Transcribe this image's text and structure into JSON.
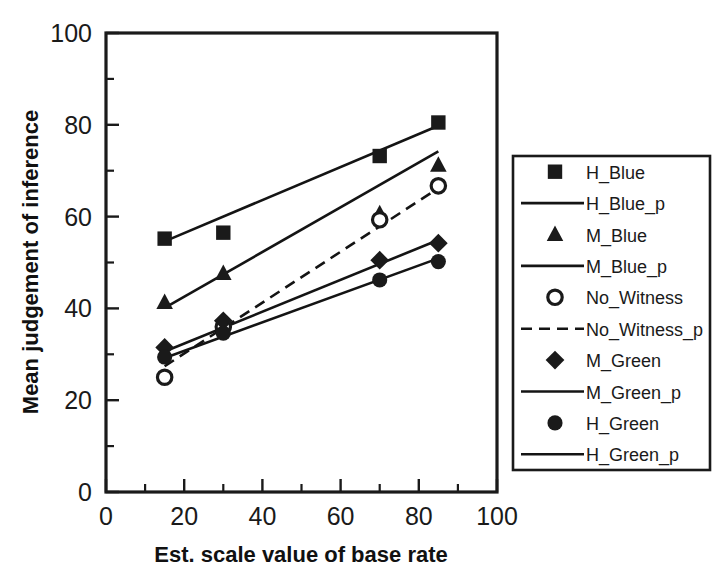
{
  "chart_data": {
    "type": "scatter",
    "title": "",
    "xlabel": "Est. scale value of base rate",
    "ylabel": "Mean judgement of inference",
    "xlim": [
      0,
      100
    ],
    "ylim": [
      0,
      100
    ],
    "xticks": [
      0,
      20,
      40,
      60,
      80,
      100
    ],
    "yticks": [
      0,
      20,
      40,
      60,
      80,
      100
    ],
    "xtick_labels": [
      "0",
      "20",
      "40",
      "60",
      "80",
      "100"
    ],
    "ytick_labels": [
      "0",
      "20",
      "40",
      "60",
      "80",
      "100"
    ],
    "minor_tick_step": 10,
    "grid": false,
    "legend_position": "right-outside",
    "x": [
      15,
      30,
      70,
      85
    ],
    "series": [
      {
        "name": "H_Blue",
        "marker": "square-filled",
        "x": [
          15,
          30,
          70,
          85
        ],
        "values": [
          55.2,
          56.5,
          73.2,
          80.5
        ]
      },
      {
        "name": "H_Blue_p",
        "marker": "line-solid",
        "fit_line": true,
        "x": [
          15,
          85
        ],
        "values": [
          54.6,
          79.8
        ]
      },
      {
        "name": "M_Blue",
        "marker": "triangle-filled",
        "x": [
          15,
          30,
          70,
          85
        ],
        "values": [
          41.3,
          47.6,
          60.6,
          71.2
        ]
      },
      {
        "name": "M_Blue_p",
        "marker": "line-solid",
        "fit_line": true,
        "x": [
          15,
          85
        ],
        "values": [
          40.1,
          74.2
        ]
      },
      {
        "name": "No_Witness",
        "marker": "circle-open",
        "x": [
          15,
          30,
          70,
          85
        ],
        "values": [
          25.0,
          36.0,
          59.3,
          66.7
        ]
      },
      {
        "name": "No_Witness_p",
        "marker": "line-dashed",
        "fit_line": true,
        "x": [
          15,
          85
        ],
        "values": [
          27.4,
          66.2
        ]
      },
      {
        "name": "M_Green",
        "marker": "diamond-filled",
        "x": [
          15,
          30,
          70,
          85
        ],
        "values": [
          31.5,
          37.3,
          50.5,
          54.2
        ]
      },
      {
        "name": "M_Green_p",
        "marker": "line-solid",
        "fit_line": true,
        "x": [
          15,
          85
        ],
        "values": [
          30.6,
          54.9
        ]
      },
      {
        "name": "H_Green",
        "marker": "circle-filled",
        "x": [
          15,
          30,
          70,
          85
        ],
        "values": [
          29.4,
          34.6,
          46.2,
          50.2
        ]
      },
      {
        "name": "H_Green_p",
        "marker": "line-solid",
        "fit_line": true,
        "x": [
          15,
          85
        ],
        "values": [
          29.2,
          50.9
        ]
      }
    ],
    "legend_entries": [
      {
        "label": "H_Blue",
        "glyph": "square-filled"
      },
      {
        "label": "H_Blue_p",
        "glyph": "line-solid"
      },
      {
        "label": "M_Blue",
        "glyph": "triangle-filled"
      },
      {
        "label": "M_Blue_p",
        "glyph": "line-solid"
      },
      {
        "label": "No_Witness",
        "glyph": "circle-open"
      },
      {
        "label": "No_Witness_p",
        "glyph": "line-dashed"
      },
      {
        "label": "M_Green",
        "glyph": "diamond-filled"
      },
      {
        "label": "M_Green_p",
        "glyph": "line-solid"
      },
      {
        "label": "H_Green",
        "glyph": "circle-filled"
      },
      {
        "label": "H_Green_p",
        "glyph": "line-solid"
      }
    ],
    "colors": {
      "ink": "#1a1a1a",
      "background": "#ffffff"
    }
  }
}
